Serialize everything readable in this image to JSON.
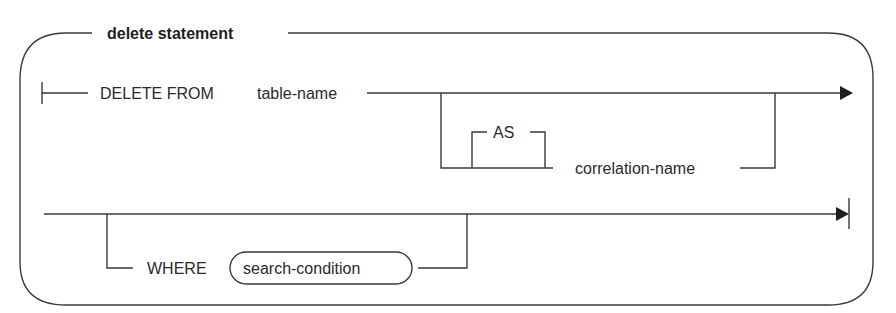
{
  "diagram": {
    "title": "delete statement",
    "row1": {
      "keywords": "DELETE FROM",
      "table": "table-name",
      "optional_branch": {
        "as_keyword": "AS",
        "correlation": "correlation-name"
      }
    },
    "row2": {
      "optional_branch": {
        "where_keyword": "WHERE",
        "search_condition": "search-condition"
      }
    },
    "colors": {
      "line": "#3a3a3a",
      "text": "#2a2a2a",
      "background": "#ffffff"
    }
  }
}
